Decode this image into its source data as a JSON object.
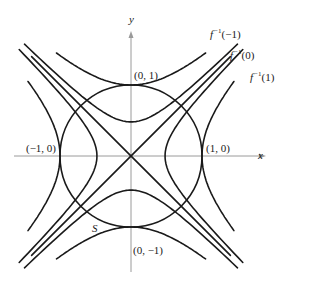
{
  "figure": {
    "axes": {
      "x_label": "x",
      "y_label": "y",
      "origin_px": [
        131,
        156
      ],
      "unit_px": 71
    },
    "circle": {
      "name": "S",
      "equation": "x^2 + y^2 = 1",
      "radius": 1
    },
    "level_sets": [
      {
        "label_fn": "f",
        "label_exp": "−1",
        "label_arg": "(−1)",
        "family": "y^2 - x^2 = 1",
        "value": -1
      },
      {
        "label_fn": "f",
        "label_exp": "−1",
        "label_arg": "(0)",
        "family": "x^2 - y^2 = 0 (with nearby curves)",
        "value": 0
      },
      {
        "label_fn": "f",
        "label_exp": "−1",
        "label_arg": "(1)",
        "family": "x^2 - y^2 = 1",
        "value": 1
      }
    ],
    "points": [
      {
        "label": "(0, 1)"
      },
      {
        "label": "(−1, 0)"
      },
      {
        "label": "(1, 0)"
      },
      {
        "label": "(0, −1)"
      }
    ],
    "surface_label": "S",
    "colors": {
      "curve": "#1a1a1a",
      "axis": "#9a9a9a",
      "background": "#ffffff"
    }
  }
}
